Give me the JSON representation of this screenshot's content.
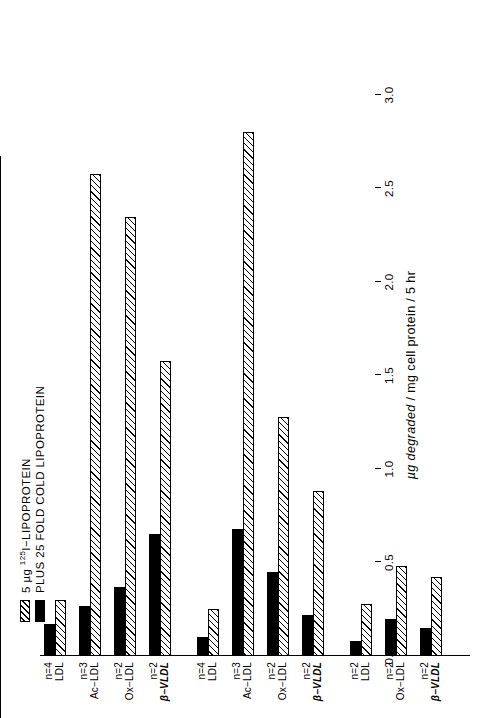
{
  "chart_data": {
    "type": "bar",
    "orientation": "horizontal-rotated",
    "title": "",
    "xlabel": "",
    "ylabel": "µg degraded / mg cell protein / 5 hr",
    "ylim": [
      0.0,
      3.0
    ],
    "ticks": [
      "0.0",
      "0.5",
      "1.0",
      "1.5",
      "2.0",
      "2.5",
      "3.0"
    ],
    "tick_values": [
      0.0,
      0.5,
      1.0,
      1.5,
      2.0,
      2.5,
      3.0
    ],
    "grid": false,
    "legend_position": "top-left",
    "series": [
      {
        "name": "5 µg 125I-LIPOPROTEIN",
        "pattern": "hatched"
      },
      {
        "name": "PLUS 25 FOLD COLD LIPOPROTEIN",
        "pattern": "solid-black"
      }
    ],
    "groups": [
      {
        "label": "RABBIT ARTERIAL MACROPHAGES",
        "label_lines": [
          "RABBIT ARTERIAL",
          "MACROPHAGES"
        ],
        "bars": [
          {
            "category": "LDL",
            "bold": false,
            "n": "n=4",
            "hatched": 0.3,
            "solid": 0.17
          },
          {
            "category": "Ac−LDL",
            "bold": false,
            "n": "n=3",
            "hatched": 2.58,
            "solid": 0.27
          },
          {
            "category": "Ox−LDL",
            "bold": false,
            "n": "n=2",
            "hatched": 2.35,
            "solid": 0.37
          },
          {
            "category": "β−VLDL",
            "bold": true,
            "n": "n=2",
            "hatched": 1.58,
            "solid": 0.65
          }
        ]
      },
      {
        "label": "MOUSE PERITONEAL MACROPHAGES",
        "label_lines": [
          "MOUSE PERITONEAL",
          "MACROPHAGES"
        ],
        "bars": [
          {
            "category": "LDL",
            "bold": false,
            "n": "n=4",
            "hatched": 0.25,
            "solid": 0.1
          },
          {
            "category": "Ac−LDL",
            "bold": false,
            "n": "n=3",
            "hatched": 2.8,
            "solid": 0.68
          },
          {
            "category": "Ox−LDL",
            "bold": false,
            "n": "n=2",
            "hatched": 1.28,
            "solid": 0.45
          },
          {
            "category": "β−VLDL",
            "bold": true,
            "n": "n=2",
            "hatched": 0.88,
            "solid": 0.22
          }
        ]
      },
      {
        "label": "HUMAN MONOCYTE/ MACROPHAGES",
        "label_lines": [
          "HUMAN MONOCYTE/",
          "MACROPHAGES"
        ],
        "bars": [
          {
            "category": "LDL",
            "bold": false,
            "n": "n=2",
            "hatched": 0.28,
            "solid": 0.08
          },
          {
            "category": "Ox−LDL",
            "bold": false,
            "n": "n=2",
            "hatched": 0.48,
            "solid": 0.2
          },
          {
            "category": "β−VLDL",
            "bold": true,
            "n": "n=2",
            "hatched": 0.42,
            "solid": 0.15
          }
        ]
      }
    ]
  },
  "legend": {
    "items": [
      {
        "swatch": "hatched",
        "prefix": "5 µg ",
        "sup": "125",
        "suffix": "I−LIPOPROTEIN"
      },
      {
        "swatch": "solid",
        "prefix": "PLUS 25 FOLD COLD LIPOPROTEIN",
        "sup": "",
        "suffix": ""
      }
    ]
  },
  "axis": {
    "title_italic": "µg degraded",
    "title_rest": " / mg cell protein / 5 hr"
  },
  "colors": {
    "ink": "#000000",
    "paper": "#ffffff"
  }
}
